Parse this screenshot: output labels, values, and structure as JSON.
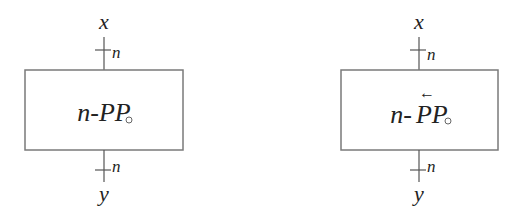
{
  "blocks": [
    {
      "id": "forward",
      "label_prefix": "n-",
      "label_main": "PP",
      "subscript": "○",
      "has_arrow_accent": false,
      "input_label": "x",
      "output_label": "y",
      "input_width": "n",
      "output_width": "n"
    },
    {
      "id": "reverse",
      "label_prefix": "n-",
      "label_main": "PP",
      "subscript": "○",
      "has_arrow_accent": true,
      "arrow_accent": "←",
      "input_label": "x",
      "output_label": "y",
      "input_width": "n",
      "output_width": "n"
    }
  ],
  "colors": {
    "stroke": "#7a7a7a",
    "text": "#222222",
    "background": "#ffffff"
  }
}
